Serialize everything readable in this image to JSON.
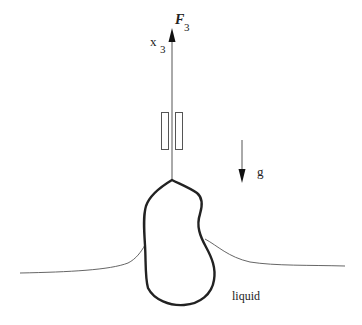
{
  "diagram": {
    "labels": {
      "force": "F",
      "force_sub": "3",
      "axis": "x",
      "axis_sub": "3",
      "gravity": "g",
      "liquid": "liquid"
    },
    "colors": {
      "stroke": "#222222",
      "thin_stroke": "#555555",
      "background": "#ffffff"
    }
  }
}
